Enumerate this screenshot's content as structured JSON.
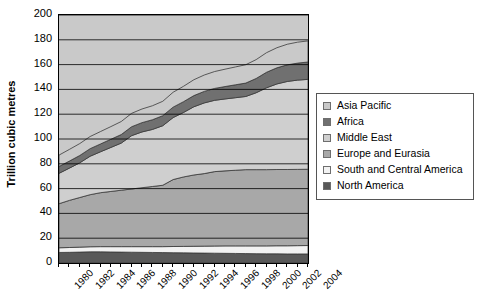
{
  "chart_data": {
    "type": "area",
    "stacked": true,
    "title": "",
    "subtitle": "",
    "xlabel": "",
    "ylabel": "Trillion cubic metres",
    "ylim": [
      0,
      200
    ],
    "y_ticks": [
      0,
      20,
      40,
      60,
      80,
      100,
      120,
      140,
      160,
      180,
      200
    ],
    "grid": true,
    "grid_axis": "y",
    "legend_position": "right",
    "x": [
      1980,
      1981,
      1982,
      1983,
      1984,
      1985,
      1986,
      1987,
      1988,
      1989,
      1990,
      1991,
      1992,
      1993,
      1994,
      1995,
      1996,
      1997,
      1998,
      1999,
      2000,
      2001,
      2002,
      2003,
      2004
    ],
    "x_tick_labels": [
      "1980",
      "1982",
      "1984",
      "1986",
      "1988",
      "1990",
      "1992",
      "1994",
      "1996",
      "1998",
      "2000",
      "2002",
      "2004"
    ],
    "series": [
      {
        "name": "North America",
        "color": "#595959",
        "values": [
          8.5,
          8.6,
          8.8,
          9.0,
          9.0,
          8.9,
          8.8,
          8.7,
          8.6,
          8.5,
          8.4,
          8.3,
          8.2,
          8.1,
          8.0,
          7.9,
          7.8,
          7.7,
          7.6,
          7.5,
          7.4,
          7.4,
          7.3,
          7.3,
          7.3
        ]
      },
      {
        "name": "South and Central America",
        "color": "#f2f2f2",
        "values": [
          3.8,
          3.9,
          4.0,
          4.1,
          4.2,
          4.3,
          4.4,
          4.5,
          4.6,
          4.7,
          4.8,
          5.0,
          5.2,
          5.4,
          5.6,
          5.8,
          6.0,
          6.1,
          6.2,
          6.3,
          6.4,
          6.5,
          6.6,
          6.7,
          6.8
        ]
      },
      {
        "name": "Europe and Eurasia",
        "color": "#a8a8a8",
        "values": [
          35.5,
          38.0,
          40.0,
          42.0,
          43.5,
          44.5,
          45.5,
          46.5,
          47.5,
          48.5,
          49.5,
          54.0,
          56.0,
          57.5,
          58.5,
          60.0,
          60.5,
          61.0,
          61.5,
          61.5,
          61.5,
          61.5,
          61.5,
          61.5,
          61.5
        ]
      },
      {
        "name": "Middle East",
        "color": "#cfcfcf",
        "values": [
          24.5,
          26.0,
          28.0,
          31.0,
          33.0,
          35.5,
          38.0,
          43.0,
          45.0,
          46.0,
          48.0,
          50.0,
          52.0,
          55.0,
          57.0,
          57.5,
          58.0,
          58.5,
          59.0,
          62.0,
          66.0,
          69.0,
          71.0,
          72.0,
          72.5
        ]
      },
      {
        "name": "Africa",
        "color": "#707070",
        "values": [
          5.5,
          5.7,
          5.9,
          6.1,
          6.3,
          6.6,
          6.9,
          7.2,
          7.5,
          7.8,
          8.1,
          8.4,
          8.7,
          9.0,
          9.3,
          9.6,
          10.0,
          10.4,
          10.8,
          11.5,
          12.5,
          13.0,
          13.4,
          13.7,
          14.0
        ]
      },
      {
        "name": "Asia Pacific",
        "color": "#c9c9c9",
        "values": [
          9.2,
          9.4,
          9.6,
          9.8,
          10.0,
          10.2,
          10.5,
          10.8,
          11.0,
          11.3,
          11.6,
          12.0,
          12.4,
          12.8,
          13.2,
          13.6,
          14.0,
          14.4,
          14.8,
          15.2,
          15.8,
          16.2,
          16.6,
          16.9,
          17.0
        ]
      }
    ],
    "totals": [
      87.0,
      91.6,
      96.3,
      102.0,
      106.0,
      110.0,
      114.1,
      120.7,
      124.2,
      126.8,
      130.4,
      137.7,
      142.5,
      147.8,
      151.6,
      154.4,
      156.3,
      158.1,
      159.9,
      164.0,
      169.6,
      173.6,
      176.4,
      178.1,
      179.1
    ]
  },
  "axis": {
    "y_title": "Trillion cubic metres"
  },
  "legend": {
    "items": [
      {
        "label": "Asia Pacific",
        "color": "#c9c9c9",
        "swatch": "legend-swatch-asia-pacific"
      },
      {
        "label": "Africa",
        "color": "#707070",
        "swatch": "legend-swatch-africa"
      },
      {
        "label": "Middle East",
        "color": "#cfcfcf",
        "swatch": "legend-swatch-middle-east"
      },
      {
        "label": "Europe and Eurasia",
        "color": "#a8a8a8",
        "swatch": "legend-swatch-europe-eurasia"
      },
      {
        "label": "South and Central America",
        "color": "#f2f2f2",
        "swatch": "legend-swatch-south-central-america"
      },
      {
        "label": "North America",
        "color": "#595959",
        "swatch": "legend-swatch-north-america"
      }
    ]
  },
  "colors": {
    "plot_background": "#c9c9c9",
    "frame": "#000000",
    "gridline": "#000000",
    "text": "#000000",
    "legend_border": "#555555"
  }
}
